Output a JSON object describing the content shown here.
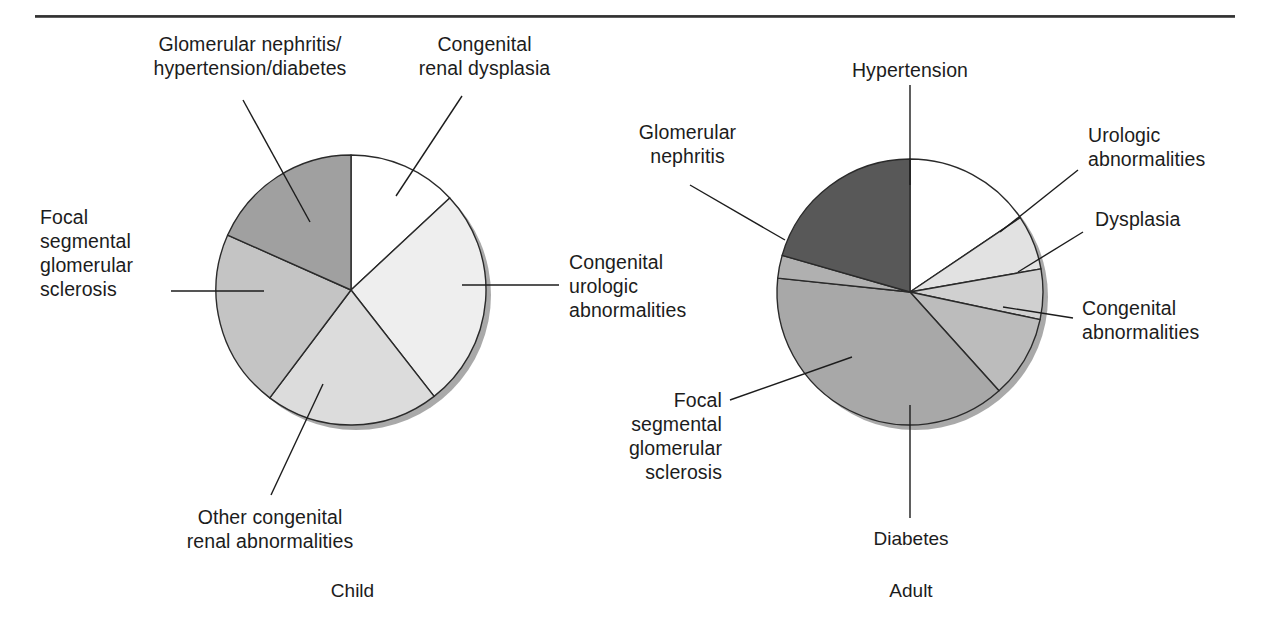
{
  "figure": {
    "has_top_rule": true,
    "background": "#ffffff",
    "text_color": "#1c1c1c"
  },
  "chart_data": [
    {
      "type": "pie",
      "title": "Child",
      "caption": "Child",
      "center": [
        351,
        290
      ],
      "radius": 135,
      "start_angle_deg": 0,
      "direction": "clockwise",
      "categories": [
        "Congenital renal dysplasia",
        "Congenital urologic abnormalities",
        "Other congenital renal abnormalities",
        "Focal segmental glomerular sclerosis",
        "Glomerular nephritis/hypertension/diabetes"
      ],
      "values": [
        13,
        26.5,
        21,
        21.5,
        18
      ],
      "angles_deg": [
        47,
        95,
        75,
        77,
        66
      ],
      "colors": [
        "#ffffff",
        "#eeeeee",
        "#dcdcdc",
        "#c4c4c4",
        "#a0a0a0"
      ],
      "legend_position": "callout-labels"
    },
    {
      "type": "pie",
      "title": "Adult",
      "caption": "Adult",
      "center": [
        910,
        292
      ],
      "radius": 133,
      "start_angle_deg": 0,
      "direction": "clockwise",
      "categories": [
        "Hypertension",
        "Urologic abnormalities",
        "Dysplasia",
        "Congenital abnormalities",
        "Diabetes",
        "Focal segmental glomerular sclerosis",
        "Glomerular nephritis"
      ],
      "values": [
        15.5,
        6.7,
        6.1,
        10,
        38.3,
        2.8,
        20.6
      ],
      "angles_deg": [
        56,
        24,
        22,
        36,
        138,
        10,
        74
      ],
      "colors": [
        "#ffffff",
        "#e2e2e2",
        "#d0d0d0",
        "#bcbcbc",
        "#a8a8a8",
        "#b0b0b0",
        "#585858"
      ],
      "legend_position": "callout-labels"
    }
  ],
  "child_chart": {
    "caption": "Child",
    "labels": {
      "glomerular_nephritis": "Glomerular nephritis/\nhypertension/diabetes",
      "congenital_renal_dysplasia": "Congenital\nrenal dysplasia",
      "focal_segmental": "Focal\nsegmental\nglomerular\nsclerosis",
      "congenital_urologic": "Congenital\nurologic\nabnormalities",
      "other_congenital": "Other congenital\nrenal abnormalities"
    }
  },
  "adult_chart": {
    "caption": "Adult",
    "labels": {
      "hypertension": "Hypertension",
      "glomerular_nephritis": "Glomerular\nnephritis",
      "urologic_abnormalities": "Urologic\nabnormalities",
      "dysplasia": "Dysplasia",
      "congenital_abnormalities": "Congenital\nabnormalities",
      "focal_segmental": "Focal\nsegmental\nglomerular\nsclerosis",
      "diabetes": "Diabetes"
    }
  }
}
